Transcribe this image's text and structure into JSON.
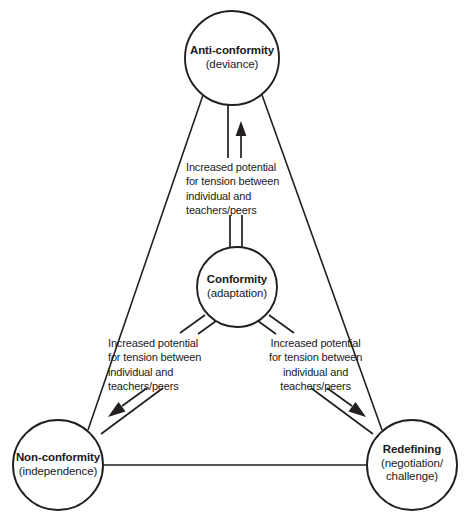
{
  "diagram": {
    "type": "triangle-relationship-diagram",
    "colors": {
      "stroke": "#231f20",
      "background": "#ffffff",
      "text": "#1a1a1a"
    },
    "nodes": [
      {
        "id": "anti-conformity",
        "title": "Anti-conformity",
        "subtitle": "(deviance)",
        "position": "top-vertex"
      },
      {
        "id": "conformity",
        "title": "Conformity",
        "subtitle": "(adaptation)",
        "position": "center"
      },
      {
        "id": "non-conformity",
        "title": "Non-conformity",
        "subtitle": "(independence)",
        "position": "bottom-left-vertex"
      },
      {
        "id": "redefining",
        "title": "Redefining",
        "subtitle_line1": "(negotiation/",
        "subtitle_line2": "challenge)",
        "position": "bottom-right-vertex"
      }
    ],
    "edge_labels": {
      "line1": "Increased potential",
      "line2": "for tension between",
      "line3": "individual and",
      "line4": "teachers/peers"
    },
    "arrows": [
      {
        "id": "conformity-to-anti-conformity",
        "from": "conformity",
        "to": "anti-conformity",
        "direction": "up"
      },
      {
        "id": "conformity-to-non-conformity",
        "from": "conformity",
        "to": "non-conformity",
        "direction": "down-left"
      },
      {
        "id": "conformity-to-redefining",
        "from": "conformity",
        "to": "redefining",
        "direction": "down-right"
      }
    ]
  }
}
